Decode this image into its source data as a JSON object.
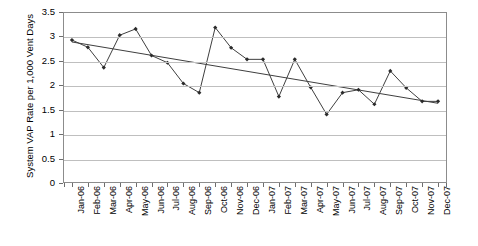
{
  "chart_data": {
    "type": "line",
    "title": "",
    "xlabel": "",
    "ylabel": "System VAP Rate per 1,000 Vent Days",
    "ylim": [
      0,
      3.5
    ],
    "yticks": [
      "0",
      "0.5",
      "1",
      "1.5",
      "2",
      "2.5",
      "3",
      "3.5"
    ],
    "ytick_values": [
      0,
      0.5,
      1,
      1.5,
      2,
      2.5,
      3,
      3.5
    ],
    "grid": true,
    "legend": "none",
    "categories": [
      "Jan-06",
      "Feb-06",
      "Mar-06",
      "Apr-06",
      "May-06",
      "Jun-06",
      "Jul-06",
      "Aug-06",
      "Sep-06",
      "Oct-06",
      "Nov-06",
      "Dec-06",
      "Jan-07",
      "Feb-07",
      "Mar-07",
      "Apr-07",
      "May-07",
      "Jun-07",
      "Jul-07",
      "Aug-07",
      "Sep-07",
      "Oct-07",
      "Nov-07",
      "Dec-07"
    ],
    "series": [
      {
        "name": "System VAP Rate",
        "marker": "diamond",
        "values": [
          2.94,
          2.79,
          2.37,
          3.04,
          3.17,
          2.62,
          2.47,
          2.04,
          1.85,
          3.2,
          2.78,
          2.54,
          2.54,
          1.77,
          2.54,
          1.96,
          1.4,
          1.85,
          1.91,
          1.61,
          2.3,
          1.95,
          1.67,
          1.67
        ]
      },
      {
        "name": "Linear trend",
        "marker": "none",
        "endpoints": [
          2.9,
          1.63
        ]
      }
    ]
  }
}
